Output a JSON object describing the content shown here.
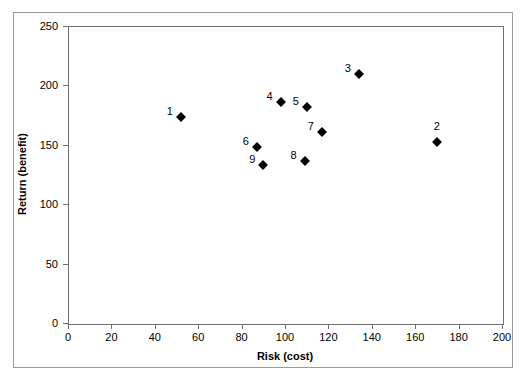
{
  "chart_data": {
    "type": "scatter",
    "title": "",
    "xlabel": "Risk (cost)",
    "ylabel": "Return (benefit)",
    "xlim": [
      0,
      200
    ],
    "ylim": [
      0,
      250
    ],
    "xticks": [
      0,
      20,
      40,
      60,
      80,
      100,
      120,
      140,
      160,
      180,
      200
    ],
    "yticks": [
      0,
      50,
      100,
      150,
      200,
      250
    ],
    "grid": false,
    "legend": false,
    "marker": "diamond",
    "marker_color": "#000000",
    "points": [
      {
        "label": "1",
        "x": 52,
        "y": 173,
        "label_pos": "left"
      },
      {
        "label": "2",
        "x": 170,
        "y": 152,
        "label_pos": "above"
      },
      {
        "label": "3",
        "x": 134,
        "y": 210,
        "label_pos": "left"
      },
      {
        "label": "4",
        "x": 98,
        "y": 186,
        "label_pos": "left"
      },
      {
        "label": "5",
        "x": 110,
        "y": 182,
        "label_pos": "left"
      },
      {
        "label": "6",
        "x": 87,
        "y": 148,
        "label_pos": "left"
      },
      {
        "label": "7",
        "x": 117,
        "y": 161,
        "label_pos": "left"
      },
      {
        "label": "8",
        "x": 109,
        "y": 136,
        "label_pos": "left"
      },
      {
        "label": "9",
        "x": 90,
        "y": 133,
        "label_pos": "left"
      }
    ]
  }
}
